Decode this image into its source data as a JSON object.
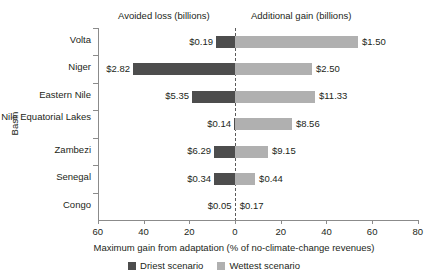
{
  "chart_data": {
    "type": "bar",
    "orientation": "horizontal",
    "layout": "diverging",
    "title": "",
    "xlabel": "Maximum gain from adaptation (% of no-climate-change revenues)",
    "ylabel": "Basin",
    "xlim": [
      -60,
      80
    ],
    "xticks": [
      60,
      40,
      20,
      0,
      20,
      40,
      60,
      80
    ],
    "grid": false,
    "zero_reference_line": true,
    "legend_position": "bottom",
    "panel_headers": {
      "left": "Avoided loss (billions)",
      "right": "Additional gain (billions)"
    },
    "categories": [
      "Volta",
      "Niger",
      "Eastern Nile",
      "Nile Equatorial Lakes",
      "Zambezi",
      "Senegal",
      "Congo"
    ],
    "series": [
      {
        "name": "Driest scenario",
        "color": "#4d4d4d",
        "side": "left",
        "values": [
          8.3,
          44.6,
          18.8,
          0.4,
          9.2,
          9.2,
          0.2
        ],
        "labels": [
          "$0.19",
          "$2.82",
          "$5.35",
          "$0.14",
          "$6.29",
          "$0.34",
          "$0.05"
        ]
      },
      {
        "name": "Wettest scenario",
        "color": "#b0b0b0",
        "side": "right",
        "values": [
          53.8,
          33.7,
          35.0,
          24.9,
          14.4,
          8.8,
          0.3
        ],
        "labels": [
          "$1.50",
          "$2.50",
          "$11.33",
          "$8.56",
          "$9.15",
          "$0.44",
          "$0.17"
        ]
      }
    ]
  },
  "legend": {
    "items": [
      {
        "label": "Driest scenario",
        "color": "#4d4d4d"
      },
      {
        "label": "Wettest scenario",
        "color": "#b0b0b0"
      }
    ]
  },
  "axis": {
    "x_title": "Maximum gain from adaptation (% of no-climate-change revenues)",
    "y_title": "Basin",
    "x_tick_labels": [
      "60",
      "40",
      "20",
      "0",
      "20",
      "40",
      "60",
      "80"
    ]
  },
  "headers": {
    "left": "Avoided loss (billions)",
    "right": "Additional gain (billions)"
  }
}
